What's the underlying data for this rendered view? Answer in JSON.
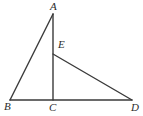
{
  "figure": {
    "canvas": {
      "width": 143,
      "height": 116,
      "background": "#ffffff"
    },
    "stroke_color": "#3a3a3a",
    "stroke_width": 1.4,
    "points": {
      "A": {
        "label": "A",
        "x": 53,
        "y": 14,
        "label_x": 50,
        "label_y": 1
      },
      "B": {
        "label": "B",
        "x": 10,
        "y": 100,
        "label_x": 4,
        "label_y": 101
      },
      "C": {
        "label": "C",
        "x": 53,
        "y": 100,
        "label_x": 49,
        "label_y": 102
      },
      "D": {
        "label": "D",
        "x": 132,
        "y": 100,
        "label_x": 131,
        "label_y": 102
      },
      "E": {
        "label": "E",
        "x": 53,
        "y": 54,
        "label_x": 58,
        "label_y": 39
      }
    },
    "segments": [
      {
        "name": "AB",
        "from": "A",
        "to": "B"
      },
      {
        "name": "AC",
        "from": "A",
        "to": "C"
      },
      {
        "name": "BD",
        "from": "B",
        "to": "D"
      },
      {
        "name": "ED",
        "from": "E",
        "to": "D"
      }
    ]
  }
}
